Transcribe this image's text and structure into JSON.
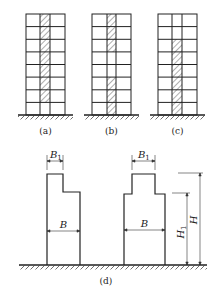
{
  "figure": {
    "frames": [
      {
        "id": "a",
        "label": "(a)",
        "stories": 8,
        "bays": 3,
        "hatched_bay": 2,
        "hatched_stories_from_bottom": [
          2,
          3,
          4,
          5,
          6,
          7,
          8
        ]
      },
      {
        "id": "b",
        "label": "(b)",
        "stories": 8,
        "bays": 3,
        "hatched_bay": 2,
        "hatched_stories_from_bottom": [
          1,
          2,
          3,
          6,
          7,
          8
        ]
      },
      {
        "id": "c",
        "label": "(c)",
        "stories": 8,
        "bays": 3,
        "hatched_bay": 2,
        "hatched_stories_from_bottom": [
          1,
          2,
          3,
          4,
          5,
          6
        ]
      }
    ],
    "setback": {
      "label": "(d)",
      "left_building": {
        "top_width_label": "B",
        "top_width_sub": "1",
        "base_width_label": "B"
      },
      "right_building": {
        "top_width_label": "B",
        "top_width_sub": "1",
        "base_width_label": "B"
      },
      "height_labels": {
        "total": "H",
        "lower": "H",
        "lower_sub": "1"
      }
    }
  }
}
